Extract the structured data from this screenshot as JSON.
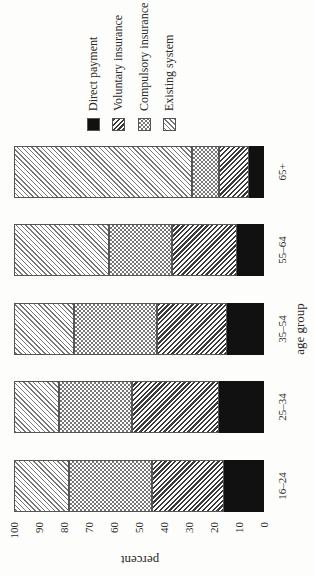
{
  "chart_data": {
    "type": "bar",
    "stacked": true,
    "orientation_note": "figure printed rotated 90 degrees counter-clockwise",
    "title": "",
    "xlabel": "age group",
    "ylabel": "percent",
    "ylim": [
      0,
      100
    ],
    "yticks": [
      "0",
      "10",
      "20",
      "30",
      "40",
      "50",
      "60",
      "70",
      "80",
      "90",
      "100"
    ],
    "grid": false,
    "legend_position": "right",
    "categories": [
      "16–24",
      "25–34",
      "35–54",
      "55–64",
      "65+"
    ],
    "series": [
      {
        "name": "Direct payment",
        "pattern": "solid black",
        "values": [
          16,
          18,
          15,
          11,
          6
        ]
      },
      {
        "name": "Voluntary insurance",
        "pattern": "dense diagonal hatch",
        "values": [
          29,
          35,
          28,
          26,
          12
        ]
      },
      {
        "name": "Compulsory insurance",
        "pattern": "checkered",
        "values": [
          33,
          29,
          33,
          25,
          11
        ]
      },
      {
        "name": "Existing system",
        "pattern": "light diagonal hatch",
        "values": [
          22,
          18,
          24,
          38,
          71
        ]
      }
    ]
  },
  "legend": [
    {
      "label": "Direct payment",
      "class": "pat-direct"
    },
    {
      "label": "Voluntary insurance",
      "class": "pat-voluntary"
    },
    {
      "label": "Compulsory insurance",
      "class": "pat-compulsory"
    },
    {
      "label": "Existing system",
      "class": "pat-existing"
    }
  ]
}
